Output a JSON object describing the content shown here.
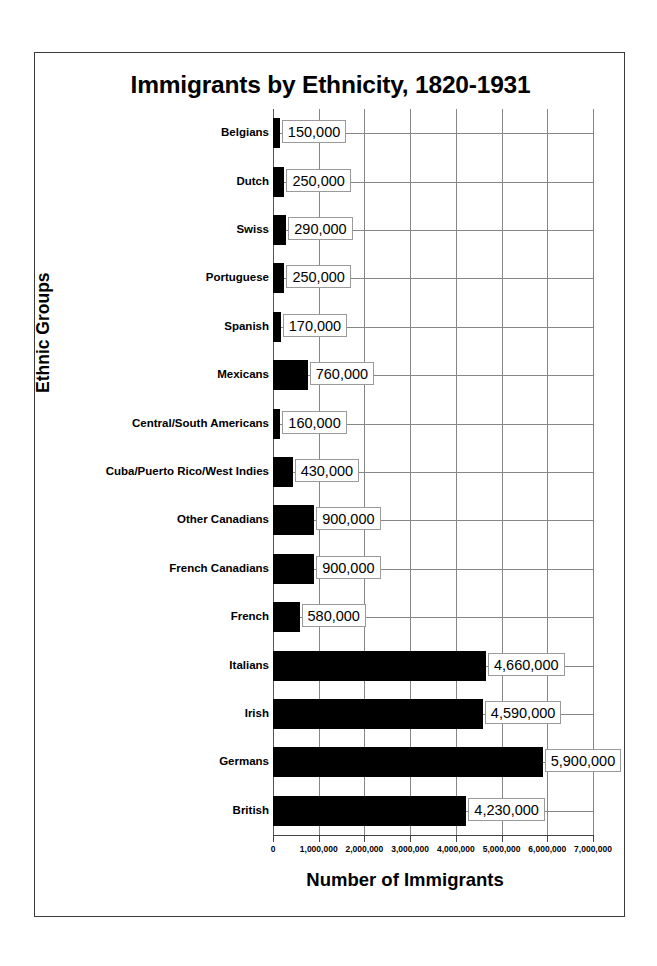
{
  "chart_data": {
    "type": "bar",
    "orientation": "horizontal",
    "title": "Immigrants by Ethnicity, 1820-1931",
    "xlabel": "Number of Immigrants",
    "ylabel": "Ethnic Groups",
    "xlim": [
      0,
      7000000
    ],
    "grid": true,
    "legend": "none",
    "bar_color": "#000000",
    "categories": [
      "Belgians",
      "Dutch",
      "Swiss",
      "Portuguese",
      "Spanish",
      "Mexicans",
      "Central/South Americans",
      "Cuba/Puerto Rico/West Indies",
      "Other Canadians",
      "French Canadians",
      "French",
      "Italians",
      "Irish",
      "Germans",
      "British"
    ],
    "values": [
      150000,
      250000,
      290000,
      250000,
      170000,
      760000,
      160000,
      430000,
      900000,
      900000,
      580000,
      4660000,
      4590000,
      5900000,
      4230000
    ],
    "value_labels": [
      "150,000",
      "250,000",
      "290,000",
      "250,000",
      "170,000",
      "760,000",
      "160,000",
      "430,000",
      "900,000",
      "900,000",
      "580,000",
      "4,660,000",
      "4,590,000",
      "5,900,000",
      "4,230,000"
    ],
    "xticks": [
      0,
      1000000,
      2000000,
      3000000,
      4000000,
      5000000,
      6000000,
      7000000
    ],
    "xtick_labels": [
      "0",
      "1,000,000",
      "2,000,000",
      "3,000,000",
      "4,000,000",
      "5,000,000",
      "6,000,000",
      "7,000,000"
    ]
  }
}
